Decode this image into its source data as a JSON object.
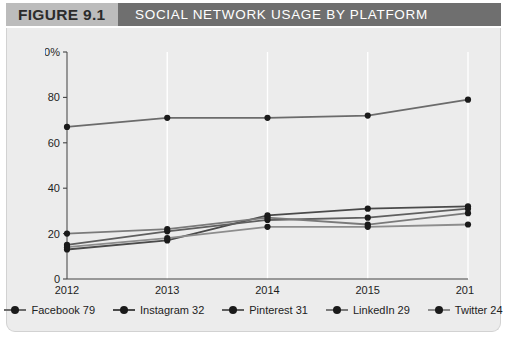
{
  "figure": {
    "tag": "FIGURE 9.1",
    "title": "SOCIAL NETWORK USAGE BY PLATFORM"
  },
  "colors": {
    "tag_band": "#bcbcbc",
    "title_band": "#6f6f6f",
    "panel": "#ececec",
    "axis": "#444444",
    "gridline": "#ffffff",
    "facebook": "#6b6b6b",
    "instagram": "#4a4a4a",
    "pinterest": "#5f5f5f",
    "linkedin": "#7a7a7a",
    "twitter": "#8d8d8d",
    "marker": "#1a1a1a"
  },
  "legend": {
    "items": [
      {
        "name": "facebook",
        "label": "Facebook 79",
        "color": "#6b6b6b"
      },
      {
        "name": "instagram",
        "label": "Instagram 32",
        "color": "#4a4a4a"
      },
      {
        "name": "pinterest",
        "label": "Pinterest 31",
        "color": "#5f5f5f"
      },
      {
        "name": "linkedin",
        "label": "LinkedIn 29",
        "color": "#7a7a7a"
      },
      {
        "name": "twitter",
        "label": "Twitter 24",
        "color": "#8d8d8d"
      }
    ]
  },
  "chart_data": {
    "type": "line",
    "title": "SOCIAL NETWORK USAGE BY PLATFORM",
    "xlabel": "",
    "ylabel": "",
    "categories": [
      "2012",
      "2013",
      "2014",
      "2015",
      "2016"
    ],
    "x_tick_labels": [
      "2012",
      "2013",
      "2014",
      "2015",
      "2016"
    ],
    "y_tick_labels": [
      "0",
      "20",
      "40",
      "60",
      "80",
      "100%"
    ],
    "y_ticks": [
      0,
      20,
      40,
      60,
      80,
      100
    ],
    "ylim": [
      0,
      100
    ],
    "grid": "vertical",
    "legend_position": "bottom",
    "series": [
      {
        "name": "Facebook",
        "values": [
          67,
          71,
          71,
          72,
          79
        ],
        "color": "#6b6b6b"
      },
      {
        "name": "Instagram",
        "values": [
          13,
          17,
          28,
          31,
          32
        ],
        "color": "#4a4a4a"
      },
      {
        "name": "Pinterest",
        "values": [
          15,
          21,
          26,
          27,
          31
        ],
        "color": "#5f5f5f"
      },
      {
        "name": "LinkedIn",
        "values": [
          20,
          22,
          27,
          24,
          29
        ],
        "color": "#7a7a7a"
      },
      {
        "name": "Twitter",
        "values": [
          14,
          18,
          23,
          23,
          24
        ],
        "color": "#8d8d8d"
      }
    ]
  }
}
